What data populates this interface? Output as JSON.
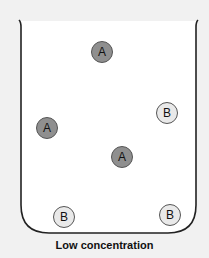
{
  "diagram": {
    "caption": "Low concentration",
    "container": "beaker",
    "colors": {
      "background": "#f1f1f1",
      "beaker_fill": "#ffffff",
      "beaker_stroke": "#222222",
      "particle_a": "#8f8f8f",
      "particle_b": "#e9e9e9"
    },
    "particles": [
      {
        "label": "A",
        "type": "a",
        "x": 102,
        "y": 52
      },
      {
        "label": "B",
        "type": "b",
        "x": 167,
        "y": 113
      },
      {
        "label": "A",
        "type": "a",
        "x": 47,
        "y": 128
      },
      {
        "label": "A",
        "type": "a",
        "x": 122,
        "y": 157
      },
      {
        "label": "B",
        "type": "b",
        "x": 64,
        "y": 217
      },
      {
        "label": "B",
        "type": "b",
        "x": 170,
        "y": 215
      }
    ]
  }
}
